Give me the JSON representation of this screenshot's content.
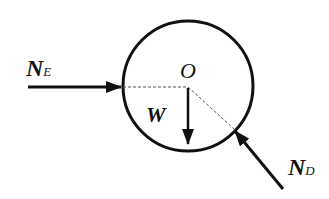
{
  "diagram": {
    "center_label": "O",
    "forces": [
      {
        "id": "NE",
        "symbol": "N",
        "subscript": "E",
        "direction": "right, toward center"
      },
      {
        "id": "W",
        "symbol": "W",
        "subscript": "",
        "direction": "down"
      },
      {
        "id": "ND",
        "symbol": "N",
        "subscript": "D",
        "direction": "up-left, toward center"
      }
    ],
    "colors": {
      "stroke": "#111111",
      "dash": "#555555",
      "background": "#ffffff"
    }
  }
}
